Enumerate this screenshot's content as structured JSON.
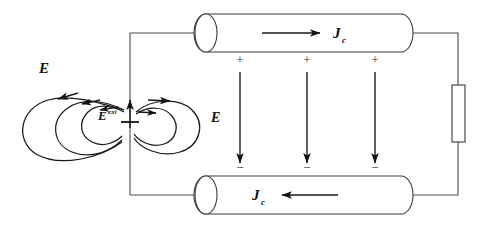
{
  "figure": {
    "background_color": "#ffffff",
    "ink_color": "#1a1a1a",
    "wire_color": "#4a4a4a"
  },
  "labels": {
    "field_outer": "E",
    "field_ext_base": "E",
    "field_ext_sup": "ext",
    "field_gap": "E",
    "current_top_base": "J",
    "current_top_sub": "c",
    "current_bottom_base": "J",
    "current_bottom_sub": "c"
  },
  "charges": {
    "positive_symbol": "+",
    "negative_symbol": "−",
    "positive_count": 3,
    "negative_count": 3,
    "positive_x": [
      240,
      307,
      375
    ],
    "negative_x": [
      240,
      307,
      375
    ],
    "positive_y": 64,
    "negative_y": 172
  },
  "conductors": [
    {
      "name": "top-conductor",
      "current_direction": "right",
      "surface_charge": "+",
      "x": 196,
      "y": 14,
      "width": 215,
      "height": 38
    },
    {
      "name": "bottom-conductor",
      "current_direction": "left",
      "surface_charge": "−",
      "x": 196,
      "y": 176,
      "width": 215,
      "height": 38
    }
  ],
  "resistor": {
    "name": "load-resistor",
    "x": 452,
    "y": 85,
    "width": 13,
    "height": 57
  },
  "emf_source": {
    "name": "emf-source",
    "direction": "up",
    "x": 130,
    "y": 112
  },
  "field_lines": {
    "left_loops": 3,
    "right_loops": 2,
    "direction": "counterclockwise-into-center"
  }
}
